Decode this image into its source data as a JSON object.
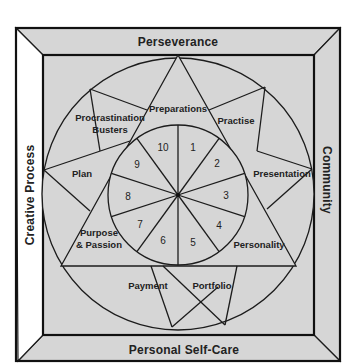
{
  "frame": {
    "top_band": "Perseverance",
    "left_band": "Creative Process",
    "right_band": "Community",
    "bottom_band": "Personal Self-Care"
  },
  "segments": {
    "preparations": "Preparations",
    "practise": "Practise",
    "presentation": "Presentation",
    "personality": "Personality",
    "portfolio": "Portfolio",
    "payment": "Payment",
    "purpose_line1": "Purpose",
    "purpose_line2": "& Passion",
    "plan": "Plan",
    "procrastination_line1": "Procrastination",
    "procrastination_line2": "Busters"
  },
  "wheel_numbers": [
    "1",
    "2",
    "3",
    "4",
    "5",
    "6",
    "7",
    "8",
    "9",
    "10"
  ],
  "colors": {
    "fill_gray": "#d6d6d6",
    "left_band_fill": "#ffffff",
    "line": "#1c1c1c"
  }
}
